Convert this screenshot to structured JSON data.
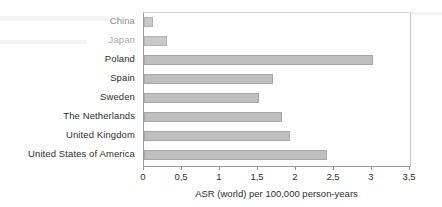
{
  "chart_data": {
    "type": "bar",
    "orientation": "horizontal",
    "title": "",
    "subtitle": "",
    "xlabel": "ASR (world) per 100,000 person-years",
    "ylabel": "",
    "categories": [
      "China",
      "Japan",
      "Poland",
      "Spain",
      "Sweden",
      "The Netherlands",
      "United Kingdom",
      "United States of America"
    ],
    "values": [
      0.12,
      0.3,
      3.01,
      1.7,
      1.51,
      1.81,
      1.92,
      2.41
    ],
    "xlim": [
      0,
      3.5
    ],
    "xticks": [
      0,
      0.5,
      1,
      1.5,
      2,
      2.5,
      3,
      3.5
    ],
    "xticklabels": [
      "0",
      "0,5",
      "1",
      "1,5",
      "2",
      "2,5",
      "3",
      "3,5"
    ],
    "decimal_separator": ",",
    "grid": false,
    "legend": false,
    "legend_position": "none",
    "bar_color": "#bfbfbf",
    "bar_border_color": "#a6a6a6",
    "axis_color": "#9a9a9a",
    "text_color": "#2f2f2f"
  },
  "axis": {
    "x_title": "ASR (world) per 100,000 person-years"
  },
  "series": {
    "name": "ASR (world)"
  }
}
